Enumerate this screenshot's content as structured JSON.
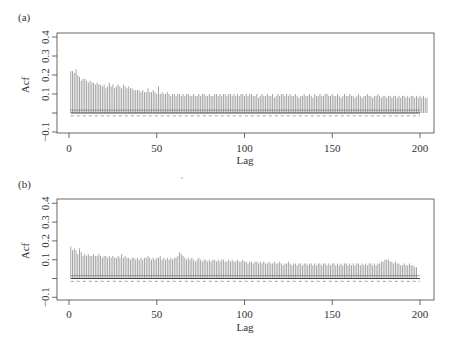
{
  "chart_data": [
    {
      "type": "bar",
      "panel_label": "(a)",
      "title": "",
      "xlabel": "Lag",
      "ylabel": "Acf",
      "xlim": [
        0,
        200
      ],
      "ylim": [
        -0.1,
        0.4
      ],
      "x_ticks": [
        0,
        50,
        100,
        150,
        200
      ],
      "y_ticks": [
        -0.1,
        0.0,
        0.1,
        0.2,
        0.3,
        0.4
      ],
      "y_tick_labels": [
        "−0.1",
        "",
        "0.1",
        "0.2",
        "0.3",
        "0.4"
      ],
      "grid": false,
      "confidence_band": [
        -0.015,
        0.015
      ],
      "series": [
        {
          "name": "ACF",
          "lags_start": 1,
          "values": [
            0.22,
            0.22,
            0.21,
            0.23,
            0.2,
            0.19,
            0.17,
            0.18,
            0.18,
            0.17,
            0.16,
            0.17,
            0.16,
            0.16,
            0.15,
            0.16,
            0.15,
            0.15,
            0.14,
            0.15,
            0.13,
            0.14,
            0.16,
            0.14,
            0.15,
            0.13,
            0.14,
            0.15,
            0.14,
            0.13,
            0.15,
            0.14,
            0.13,
            0.14,
            0.13,
            0.13,
            0.12,
            0.12,
            0.12,
            0.12,
            0.11,
            0.12,
            0.11,
            0.11,
            0.13,
            0.11,
            0.11,
            0.12,
            0.11,
            0.1,
            0.14,
            0.1,
            0.11,
            0.1,
            0.1,
            0.11,
            0.1,
            0.09,
            0.1,
            0.1,
            0.09,
            0.1,
            0.1,
            0.09,
            0.1,
            0.09,
            0.1,
            0.1,
            0.09,
            0.09,
            0.1,
            0.09,
            0.09,
            0.1,
            0.09,
            0.1,
            0.1,
            0.09,
            0.09,
            0.1,
            0.09,
            0.09,
            0.1,
            0.1,
            0.09,
            0.1,
            0.09,
            0.1,
            0.1,
            0.09,
            0.1,
            0.1,
            0.09,
            0.1,
            0.09,
            0.1,
            0.09,
            0.1,
            0.1,
            0.09,
            0.1,
            0.09,
            0.1,
            0.1,
            0.09,
            0.09,
            0.1,
            0.08,
            0.09,
            0.1,
            0.09,
            0.09,
            0.1,
            0.09,
            0.09,
            0.1,
            0.08,
            0.09,
            0.1,
            0.09,
            0.1,
            0.1,
            0.09,
            0.1,
            0.09,
            0.1,
            0.09,
            0.09,
            0.1,
            0.09,
            0.08,
            0.09,
            0.09,
            0.1,
            0.09,
            0.09,
            0.1,
            0.09,
            0.08,
            0.1,
            0.09,
            0.09,
            0.1,
            0.09,
            0.09,
            0.1,
            0.1,
            0.09,
            0.09,
            0.1,
            0.09,
            0.09,
            0.1,
            0.09,
            0.08,
            0.09,
            0.1,
            0.09,
            0.09,
            0.1,
            0.09,
            0.09,
            0.08,
            0.09,
            0.1,
            0.09,
            0.08,
            0.09,
            0.09,
            0.1,
            0.09,
            0.09,
            0.08,
            0.09,
            0.09,
            0.1,
            0.09,
            0.08,
            0.09,
            0.09,
            0.08,
            0.09,
            0.09,
            0.08,
            0.09,
            0.09,
            0.08,
            0.09,
            0.08,
            0.09,
            0.09,
            0.08,
            0.09,
            0.08,
            0.09,
            0.09,
            0.08,
            0.09,
            0.08,
            0.09,
            0.08,
            0.09,
            0.08,
            0.08
          ]
        }
      ]
    },
    {
      "type": "bar",
      "panel_label": "(b)",
      "title": "",
      "xlabel": "Lag",
      "ylabel": "Acf",
      "xlim": [
        0,
        200
      ],
      "ylim": [
        -0.1,
        0.4
      ],
      "x_ticks": [
        0,
        50,
        100,
        150,
        200
      ],
      "y_ticks": [
        -0.1,
        0.0,
        0.1,
        0.2,
        0.3,
        0.4
      ],
      "y_tick_labels": [
        "−0.1",
        "",
        "0.1",
        "0.2",
        "0.3",
        "0.4"
      ],
      "grid": false,
      "confidence_band": [
        -0.015,
        0.015
      ],
      "series": [
        {
          "name": "ACF",
          "lags_start": 1,
          "values": [
            0.17,
            0.15,
            0.16,
            0.15,
            0.13,
            0.16,
            0.14,
            0.12,
            0.13,
            0.12,
            0.13,
            0.12,
            0.12,
            0.13,
            0.12,
            0.12,
            0.13,
            0.12,
            0.11,
            0.12,
            0.12,
            0.11,
            0.12,
            0.11,
            0.12,
            0.11,
            0.11,
            0.12,
            0.11,
            0.13,
            0.11,
            0.12,
            0.11,
            0.11,
            0.1,
            0.11,
            0.11,
            0.1,
            0.11,
            0.1,
            0.11,
            0.1,
            0.11,
            0.11,
            0.12,
            0.11,
            0.1,
            0.11,
            0.1,
            0.11,
            0.11,
            0.12,
            0.1,
            0.11,
            0.1,
            0.11,
            0.1,
            0.11,
            0.1,
            0.11,
            0.11,
            0.12,
            0.14,
            0.13,
            0.12,
            0.11,
            0.1,
            0.11,
            0.1,
            0.11,
            0.1,
            0.09,
            0.1,
            0.11,
            0.1,
            0.09,
            0.1,
            0.1,
            0.09,
            0.1,
            0.09,
            0.1,
            0.1,
            0.09,
            0.1,
            0.09,
            0.1,
            0.1,
            0.09,
            0.09,
            0.1,
            0.09,
            0.1,
            0.09,
            0.09,
            0.1,
            0.09,
            0.09,
            0.1,
            0.09,
            0.09,
            0.08,
            0.09,
            0.09,
            0.08,
            0.09,
            0.09,
            0.08,
            0.09,
            0.08,
            0.09,
            0.08,
            0.08,
            0.09,
            0.08,
            0.08,
            0.09,
            0.08,
            0.08,
            0.09,
            0.08,
            0.07,
            0.08,
            0.08,
            0.09,
            0.08,
            0.07,
            0.08,
            0.08,
            0.07,
            0.08,
            0.08,
            0.07,
            0.08,
            0.08,
            0.07,
            0.08,
            0.08,
            0.07,
            0.08,
            0.07,
            0.08,
            0.08,
            0.07,
            0.08,
            0.08,
            0.07,
            0.08,
            0.07,
            0.08,
            0.08,
            0.07,
            0.08,
            0.07,
            0.08,
            0.07,
            0.08,
            0.08,
            0.07,
            0.08,
            0.07,
            0.08,
            0.07,
            0.08,
            0.08,
            0.07,
            0.08,
            0.07,
            0.08,
            0.07,
            0.08,
            0.08,
            0.07,
            0.08,
            0.07,
            0.08,
            0.08,
            0.09,
            0.09,
            0.1,
            0.1,
            0.1,
            0.09,
            0.09,
            0.08,
            0.09,
            0.08,
            0.08,
            0.07,
            0.07,
            0.08,
            0.07,
            0.07,
            0.08,
            0.07,
            0.07,
            0.06,
            0.06
          ]
        }
      ]
    }
  ],
  "panels": [
    {
      "label": "(a)",
      "ylabel": "Acf",
      "xlabel": "Lag",
      "y_tick_labels": [
        "−0.1",
        "0.1",
        "0.2",
        "0.3",
        "0.4"
      ],
      "x_tick_labels": [
        "0",
        "50",
        "100",
        "150",
        "200"
      ]
    },
    {
      "label": "(b)",
      "ylabel": "Acf",
      "xlabel": "Lag",
      "y_tick_labels": [
        "−0.1",
        "0.1",
        "0.2",
        "0.3",
        "0.4"
      ],
      "x_tick_labels": [
        "0",
        "50",
        "100",
        "150",
        "200"
      ]
    }
  ],
  "colors": {
    "bars": "#9a9a9a",
    "axes": "#444444",
    "zero_line": "#333333",
    "band_dashed": "#666666"
  }
}
